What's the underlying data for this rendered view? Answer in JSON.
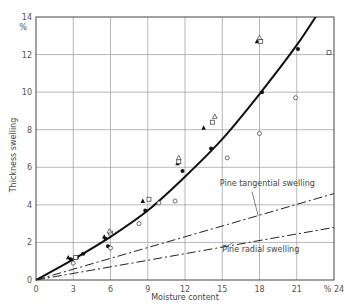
{
  "chart_data": {
    "type": "scatter",
    "title": "",
    "xlabel": "Moisture content",
    "ylabel": "Thickness swelling",
    "x_unit": "%",
    "y_unit": "%",
    "xlim": [
      0,
      24
    ],
    "ylim": [
      0,
      14
    ],
    "xticks": [
      0,
      3,
      6,
      9,
      12,
      15,
      18,
      21,
      24
    ],
    "yticks": [
      0,
      2,
      4,
      6,
      8,
      10,
      12,
      14
    ],
    "xtick_labels": [
      "0",
      "3",
      "6",
      "9",
      "12",
      "15",
      "18",
      "21",
      "% 24"
    ],
    "ytick_labels": [
      "0",
      "2",
      "4",
      "6",
      "8",
      "10",
      "12",
      "14"
    ],
    "grid": true,
    "series": [
      {
        "name": "Thickness swelling fit",
        "style": "solid-thick",
        "x": [
          0,
          3,
          6,
          9,
          12,
          15,
          18,
          21,
          23
        ],
        "y": [
          0,
          1.1,
          2.3,
          3.7,
          5.5,
          7.5,
          9.9,
          12.5,
          14.5
        ]
      },
      {
        "name": "Pine tangential swelling",
        "label": "Pine tangential swelling",
        "style": "dash-dot",
        "x": [
          0,
          24
        ],
        "y": [
          0,
          4.6
        ]
      },
      {
        "name": "Pine radial swelling",
        "label": "Pine radial swelling",
        "style": "dash-dot",
        "x": [
          0,
          24
        ],
        "y": [
          0,
          2.8
        ]
      },
      {
        "name": "filled circles",
        "marker": "circle-filled",
        "x": [
          2.8,
          3.3,
          3.8,
          5.6,
          5.8,
          8.8,
          11.8,
          14.1,
          18.2,
          21.1
        ],
        "y": [
          1.1,
          1.2,
          1.4,
          2.2,
          1.8,
          3.7,
          5.8,
          7.0,
          10.0,
          12.3
        ]
      },
      {
        "name": "filled triangles",
        "marker": "triangle-filled",
        "x": [
          2.6,
          5.5,
          8.6,
          11.4,
          13.5,
          17.8
        ],
        "y": [
          1.2,
          2.3,
          4.2,
          6.2,
          8.1,
          12.7
        ]
      },
      {
        "name": "open squares",
        "marker": "square-open",
        "x": [
          3.2,
          6.0,
          9.1,
          11.5,
          14.2,
          18.1,
          23.6
        ],
        "y": [
          1.2,
          2.5,
          4.3,
          6.3,
          8.4,
          12.7,
          12.1
        ]
      },
      {
        "name": "open triangles",
        "marker": "triangle-open",
        "x": [
          5.9,
          11.5,
          14.4,
          18.0
        ],
        "y": [
          2.6,
          6.5,
          8.7,
          12.9
        ]
      },
      {
        "name": "open circles",
        "marker": "circle-open",
        "x": [
          3.0,
          6.0,
          8.3,
          9.9,
          11.2,
          15.4,
          18.0,
          20.9
        ],
        "y": [
          0.9,
          1.7,
          3.0,
          4.1,
          4.2,
          6.5,
          7.8,
          9.7
        ]
      }
    ],
    "annotations": [
      {
        "text": "Pine tangential swelling",
        "x": 14.8,
        "y": 5.0
      },
      {
        "text": "Pine radial swelling",
        "x": 15.0,
        "y": 1.5
      }
    ],
    "legend": "none"
  }
}
